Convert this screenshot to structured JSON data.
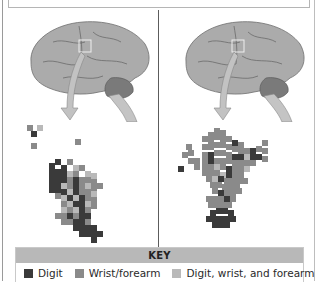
{
  "figure": {
    "caption_partial": "",
    "colors": {
      "digit": "#3a3a3a",
      "wrist_forearm": "#8a8a8a",
      "digit_wrist_forearm": "#b9b9b9",
      "brain_fill": "#a9a9a9",
      "brain_dark": "#7d7d7d",
      "arrow": "#bdbdbd",
      "key_header": "#b8b8b8"
    },
    "panels": [
      {
        "id": "left",
        "label": "",
        "dominant": "digit and mixed"
      },
      {
        "id": "right",
        "label": "",
        "dominant": "wrist/forearm"
      }
    ]
  },
  "key": {
    "title": "KEY",
    "items": [
      {
        "label": "Digit",
        "color": "#3a3a3a"
      },
      {
        "label": "Wrist/forearm",
        "color": "#8a8a8a"
      },
      {
        "label": "Digit, wrist, and forearm",
        "color": "#b9b9b9"
      }
    ]
  }
}
